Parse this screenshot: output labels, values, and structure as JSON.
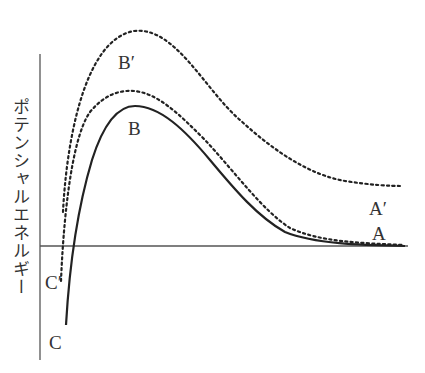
{
  "diagram": {
    "ylabel": "ポテンシャルエネルギー",
    "labels": {
      "A": "A",
      "A_prime": "A′",
      "B": "B",
      "B_prime": "B′",
      "C": "C",
      "C_prime": "C′"
    },
    "colors": {
      "curve": "#222222",
      "axis": "#555555",
      "text": "#333333"
    },
    "curves": [
      {
        "name": "solid-curve",
        "style": "solid",
        "points": "A → B → C"
      },
      {
        "name": "inner-dotted-curve",
        "style": "dotted",
        "points": "A → B′ → C′"
      },
      {
        "name": "outer-dotted-curve",
        "style": "dotted",
        "points": "A′ → top peak"
      }
    ]
  }
}
